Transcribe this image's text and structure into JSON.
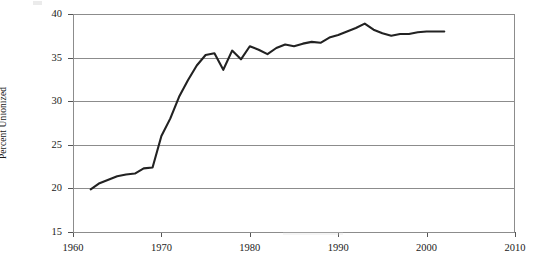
{
  "chart_data": {
    "type": "line",
    "title": "",
    "xlabel": "",
    "ylabel": "Percent Unionized",
    "xlim": [
      1960,
      2010
    ],
    "ylim": [
      15,
      40
    ],
    "xticks": [
      1960,
      1970,
      1980,
      1990,
      2000,
      2010
    ],
    "yticks": [
      15,
      20,
      25,
      30,
      35,
      40
    ],
    "grid": true,
    "legend": false,
    "line_color": "#222222",
    "grid_color": "#8c8c8c",
    "x": [
      1962,
      1963,
      1964,
      1965,
      1966,
      1967,
      1968,
      1969,
      1970,
      1971,
      1972,
      1973,
      1974,
      1975,
      1976,
      1977,
      1978,
      1979,
      1980,
      1981,
      1982,
      1983,
      1984,
      1985,
      1986,
      1987,
      1988,
      1989,
      1990,
      1991,
      1992,
      1993,
      1994,
      1995,
      1996,
      1997,
      1998,
      1999,
      2000,
      2001,
      2002
    ],
    "values": [
      19.9,
      20.6,
      21.0,
      21.4,
      21.6,
      21.7,
      22.3,
      22.4,
      26.0,
      28.0,
      30.5,
      32.4,
      34.1,
      35.3,
      35.5,
      33.6,
      35.8,
      34.8,
      36.3,
      35.9,
      35.4,
      36.1,
      36.5,
      36.3,
      36.6,
      36.8,
      36.7,
      37.3,
      37.6,
      38.0,
      38.4,
      38.9,
      38.2,
      37.8,
      37.5,
      37.7,
      37.7,
      37.9,
      38.0,
      38.0,
      38.0
    ],
    "series_name": "Percent Unionized"
  },
  "axis": {
    "y_tick_labels": [
      "40",
      "35",
      "30",
      "25",
      "20",
      "15"
    ],
    "x_tick_labels": [
      "1960",
      "1970",
      "1980",
      "1990",
      "2000",
      "2010"
    ]
  }
}
